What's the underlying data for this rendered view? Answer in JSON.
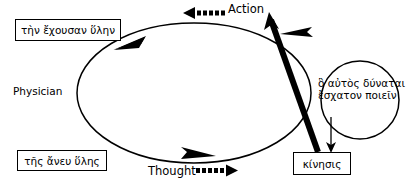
{
  "diagram": {
    "title_caption": "",
    "canvas": {
      "width": 412,
      "height": 191,
      "background": "#ffffff",
      "ink": "#000000"
    },
    "nodes": {
      "top_left_box": {
        "label": "τὴν ἔχουσαν ὕλην",
        "shape": "rectangle"
      },
      "bottom_left_box": {
        "label": "τῆς ἄνευ ὕλης",
        "shape": "rectangle"
      },
      "bottom_right_box": {
        "label": "κίνησις",
        "shape": "rectangle"
      },
      "circle": {
        "line1": "ὃ αὐτὸς δύναται",
        "line2": "ἔσχατον ποιεῖν",
        "shape": "circle"
      }
    },
    "labels": {
      "physician": "Physician",
      "action": "Action",
      "thought": "Thought"
    },
    "connectors": {
      "action_arrow": {
        "label": "Action",
        "style": "dotted",
        "direction": "left"
      },
      "thought_arrow": {
        "label": "Thought",
        "style": "dotted",
        "direction": "right"
      },
      "loop": {
        "style": "solid-ellipse",
        "arrowheads": 3
      },
      "thick_diagonal": {
        "style": "solid-thick",
        "direction": "up-left"
      },
      "circle_to_kinesis": {
        "style": "solid-thin",
        "direction": "down"
      }
    }
  }
}
